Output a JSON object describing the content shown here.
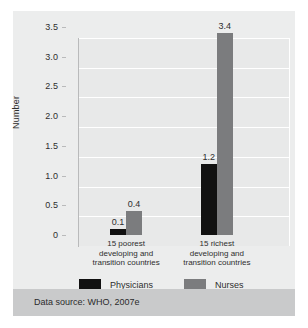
{
  "figure": {
    "source_note": "Data source: WHO, 2007e"
  },
  "chart_data": {
    "type": "bar",
    "title": "",
    "subtitle": "",
    "xlabel": "",
    "ylabel": "Number",
    "ylim": [
      0,
      3.5
    ],
    "grid": true,
    "legend_position": "bottom-left",
    "categories": [
      "15 poorest developing and transition countries",
      "15 richest developing and transition countries"
    ],
    "category_lines": [
      [
        "15 poorest",
        "developing and",
        "transition countries"
      ],
      [
        "15 richest",
        "developing and",
        "transition countries"
      ]
    ],
    "series": [
      {
        "name": "Physicians",
        "color": "#111111",
        "values": [
          0.1,
          1.2
        ],
        "labels": [
          "0.1",
          "1.2"
        ]
      },
      {
        "name": "Nurses",
        "color": "#7b7c7e",
        "values": [
          0.4,
          3.4
        ],
        "labels": [
          "0.4",
          "3.4"
        ]
      }
    ],
    "yticks": [
      3.5,
      3.0,
      2.5,
      2.0,
      1.5,
      1.0,
      0.5,
      0
    ],
    "ytick_labels": [
      "3.5",
      "3.0",
      "2.5",
      "2.0",
      "1.5",
      "1.0",
      "0.5",
      "0"
    ],
    "colors": {
      "panel_background": "#e8e9e9",
      "card_background": "#eceded",
      "gridline": "#ffffff",
      "source_bar": "#c9cacb",
      "axis": "#b9babb",
      "text": "#2e2e2e"
    }
  }
}
